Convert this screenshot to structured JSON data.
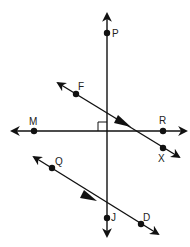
{
  "diagram": {
    "type": "geometry-lines",
    "colors": {
      "line": "#111111",
      "label": "#222222",
      "background": "#ffffff"
    },
    "lines": [
      {
        "id": "PJ",
        "name": "line PJ (vertical)",
        "points": [
          "P",
          "J"
        ]
      },
      {
        "id": "MR",
        "name": "line MR (horizontal)",
        "points": [
          "M",
          "R"
        ]
      },
      {
        "id": "FX",
        "name": "line FX",
        "points": [
          "F",
          "X"
        ],
        "parallel_mark": true
      },
      {
        "id": "QD",
        "name": "line QD",
        "points": [
          "Q",
          "D"
        ],
        "parallel_mark": true
      }
    ],
    "points": {
      "P": {
        "label": "P"
      },
      "J": {
        "label": "J"
      },
      "M": {
        "label": "M"
      },
      "R": {
        "label": "R"
      },
      "F": {
        "label": "F"
      },
      "X": {
        "label": "X"
      },
      "Q": {
        "label": "Q"
      },
      "D": {
        "label": "D"
      }
    },
    "annotations": {
      "right_angle": "right angle mark at intersection of line PJ and line MR",
      "parallel": "single arrow marks on FX and QD indicate they are parallel"
    }
  }
}
